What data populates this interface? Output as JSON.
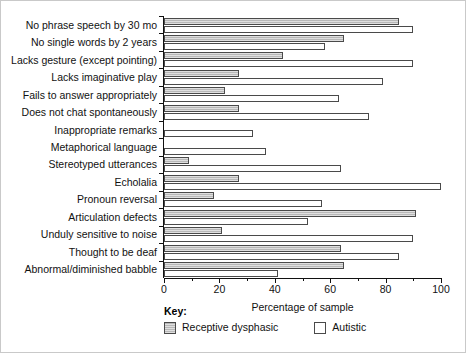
{
  "chart_data": {
    "type": "bar",
    "orientation": "horizontal",
    "title": "",
    "xlabel": "Percentage of sample",
    "ylabel": "",
    "xlim": [
      0,
      100
    ],
    "xticks": [
      0,
      20,
      40,
      60,
      80,
      100
    ],
    "xtick_labels": [
      "0",
      "20",
      "40",
      "60",
      "80",
      "100"
    ],
    "minor_xticks": [
      10,
      30,
      50,
      70,
      90
    ],
    "grid": false,
    "legend_position": "bottom-left",
    "legend_title": "Key:",
    "categories": [
      "No phrase speech by 30 mo",
      "No single words by 2 years",
      "Lacks gesture (except pointing)",
      "Lacks imaginative play",
      "Fails to answer appropriately",
      "Does not chat spontaneously",
      "Inappropriate remarks",
      "Metaphorical language",
      "Stereotyped utterances",
      "Echolalia",
      "Pronoun reversal",
      "Articulation defects",
      "Unduly sensitive to noise",
      "Thought to be deaf",
      "Abnormal/diminished babble"
    ],
    "series": [
      {
        "name": "Receptive dysphasic",
        "color": "#b8b8b8",
        "values": [
          85,
          65,
          43,
          27,
          22,
          27,
          0,
          0,
          9,
          27,
          18,
          91,
          21,
          64,
          65
        ]
      },
      {
        "name": "Autistic",
        "color": "#ffffff",
        "values": [
          90,
          58,
          90,
          79,
          63,
          74,
          32,
          37,
          64,
          100,
          57,
          52,
          90,
          85,
          41
        ]
      }
    ]
  },
  "key": {
    "title": "Key:",
    "items": [
      {
        "label": "Receptive dysphasic",
        "style": "gray"
      },
      {
        "label": "Autistic",
        "style": "white"
      }
    ]
  }
}
